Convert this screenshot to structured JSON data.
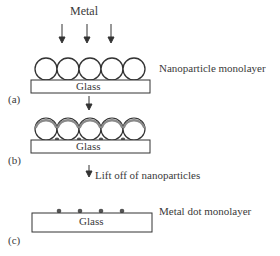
{
  "diagram": {
    "type": "process",
    "panels": [
      {
        "id": "a",
        "label": "(a)",
        "top_label": "Metal",
        "side_label": "Nanoparticle monolayer",
        "substrate_label": "Glass"
      },
      {
        "id": "b",
        "label": "(b)",
        "substrate_label": "Glass"
      },
      {
        "id": "c",
        "label": "(c)",
        "side_label": "Metal dot monolayer",
        "substrate_label": "Glass"
      }
    ],
    "steps": [
      {
        "from": "a",
        "to": "b",
        "label": ""
      },
      {
        "from": "b",
        "to": "c",
        "label": "Lift off of nanoparticles"
      }
    ],
    "colors": {
      "outline": "#333333",
      "metal_coating": "#8a8a8a",
      "dot": "#555555"
    }
  }
}
